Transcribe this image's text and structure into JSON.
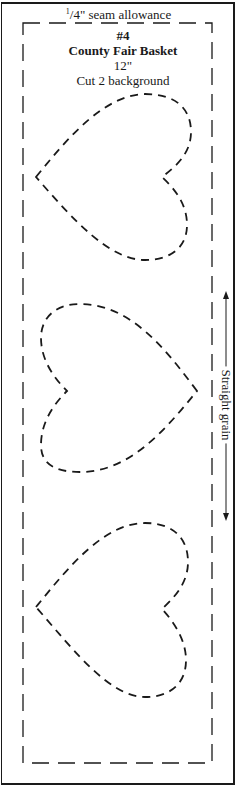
{
  "pattern": {
    "seam_allowance": {
      "fraction_numerator": "1",
      "fraction_rest": "/4\" seam allowance"
    },
    "block_number": "#4",
    "block_name": "County Fair Basket",
    "size": "12\"",
    "cut_instruction": "Cut 2 background",
    "grain_label": "Straight grain",
    "shapes": [
      {
        "name": "heart",
        "orientation": "point-left"
      },
      {
        "name": "heart",
        "orientation": "point-right"
      },
      {
        "name": "heart",
        "orientation": "point-left"
      }
    ],
    "colors": {
      "ink": "#1a1a1a",
      "paper": "#ffffff"
    }
  }
}
